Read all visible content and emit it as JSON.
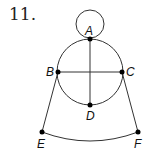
{
  "problem_number": "11.",
  "points": {
    "A": {
      "label": "A",
      "x": 90,
      "y": 39
    },
    "B": {
      "label": "B",
      "x": 58,
      "y": 72
    },
    "C": {
      "label": "C",
      "x": 122,
      "y": 72
    },
    "D": {
      "label": "D",
      "x": 90,
      "y": 105
    },
    "E": {
      "label": "E",
      "x": 42,
      "y": 132
    },
    "F": {
      "label": "F",
      "x": 138,
      "y": 132
    }
  },
  "colors": {
    "stroke": "#333333",
    "point": "#000000"
  }
}
